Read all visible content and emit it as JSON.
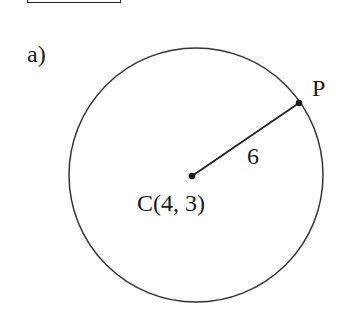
{
  "part_label": "a)",
  "diagram": {
    "type": "circle",
    "center": {
      "label": "C(4, 3)",
      "x": 4,
      "y": 3
    },
    "point": {
      "label": "P"
    },
    "radius_label": "6",
    "radius": 6
  }
}
